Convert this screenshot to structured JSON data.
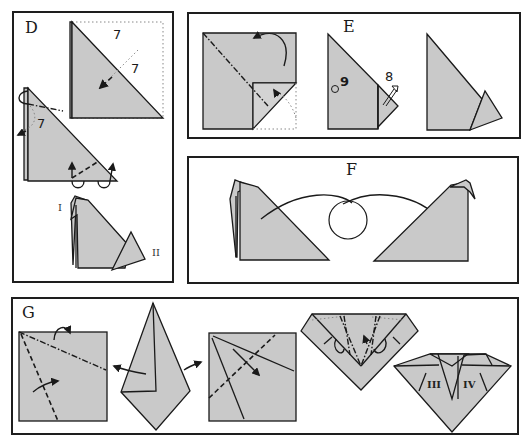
{
  "diagram": {
    "type": "origami-instructions",
    "colors": {
      "paper": "#c9c9c9",
      "outline": "#1a1a1a",
      "background": "#ffffff",
      "guide_dotted": "#888888"
    },
    "panels": [
      {
        "id": "D",
        "label": "D",
        "step_numbers": [
          "7",
          "7",
          "7"
        ],
        "part_labels": [
          "I",
          "II"
        ],
        "steps": [
          "Folded right triangle with dotted square outline; valley fold arrow marked 7",
          "Triangle with mountain fold at top (marked 7) and inside-reverse folds at bottom",
          "Resulting shape with head (I) and tail (II)"
        ]
      },
      {
        "id": "E",
        "label": "E",
        "step_numbers": [
          "9",
          "8"
        ],
        "symbols": [
          "circle-marker",
          "open-arrow"
        ],
        "steps": [
          "Square with diagonal mountain fold and flap folded back",
          "Triangle shape with step 9 marker and step 8 open arrow",
          "Resulting tail shape"
        ]
      },
      {
        "id": "F",
        "label": "F",
        "symbols": [
          "turn-over-circle"
        ],
        "steps": [
          "Left-facing figure",
          "Turn over arrow with circle",
          "Right-facing figure"
        ]
      },
      {
        "id": "G",
        "label": "G",
        "part_labels": [
          "III",
          "IV"
        ],
        "steps": [
          "Square with mountain and valley folds",
          "Kite shape with unfold arrows",
          "Square with crease lines and valley fold",
          "Inverted triangle with reverse folds",
          "Resulting shape with parts III and IV"
        ]
      }
    ]
  }
}
